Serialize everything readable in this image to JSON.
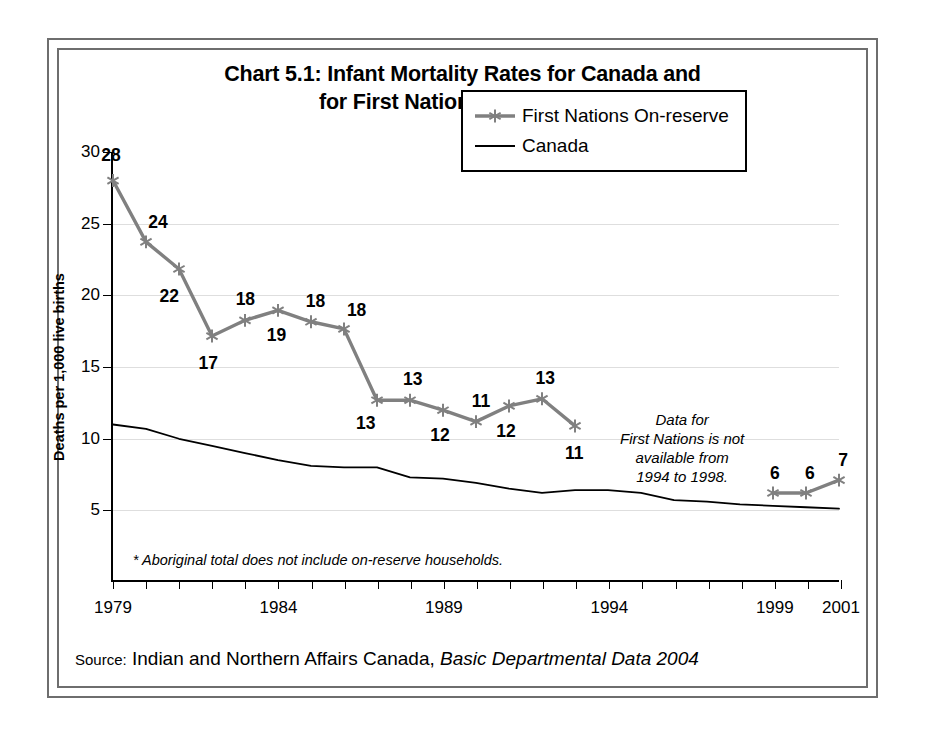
{
  "chart_data": {
    "type": "line",
    "xlabel": "",
    "ylabel": "Deaths per 1,000 live births",
    "xlim": [
      1979,
      2001
    ],
    "ylim": [
      0,
      30
    ],
    "yticks": [
      5,
      10,
      15,
      20,
      25,
      30
    ],
    "xticks": [
      1979,
      1980,
      1981,
      1982,
      1983,
      1984,
      1985,
      1986,
      1987,
      1988,
      1989,
      1990,
      1991,
      1992,
      1993,
      1994,
      1995,
      1996,
      1997,
      1998,
      1999,
      2000,
      2001
    ],
    "xtick_labels": [
      {
        "year": 1979,
        "label": "1979"
      },
      {
        "year": 1984,
        "label": "1984"
      },
      {
        "year": 1989,
        "label": "1989"
      },
      {
        "year": 1994,
        "label": "1994"
      },
      {
        "year": 1999,
        "label": "1999"
      },
      {
        "year": 2001,
        "label": "2001"
      }
    ],
    "grid": true,
    "legend_position": "upper right",
    "series": [
      {
        "name": "First Nations On-reserve",
        "color": "#808080",
        "marker": "asterisk",
        "show_labels": true,
        "segments": [
          {
            "points": [
              {
                "x": 1979,
                "y": 28,
                "label": "28",
                "lx": -2,
                "ly": -26
              },
              {
                "x": 1980,
                "y": 23.7,
                "label": "24",
                "lx": 12,
                "ly": -20
              },
              {
                "x": 1981,
                "y": 21.8,
                "label": "22",
                "lx": -10,
                "ly": 26
              },
              {
                "x": 1982,
                "y": 17.1,
                "label": "17",
                "lx": -4,
                "ly": 26
              },
              {
                "x": 1983,
                "y": 18.2,
                "label": "18",
                "lx": 0,
                "ly": -22
              },
              {
                "x": 1984,
                "y": 18.9,
                "label": "19",
                "lx": -2,
                "ly": 24
              },
              {
                "x": 1985,
                "y": 18.1,
                "label": "18",
                "lx": 4,
                "ly": -22
              },
              {
                "x": 1986,
                "y": 17.6,
                "label": "18",
                "lx": 12,
                "ly": -20
              },
              {
                "x": 1987,
                "y": 12.6,
                "label": "13",
                "lx": -12,
                "ly": 22
              },
              {
                "x": 1988,
                "y": 12.6,
                "label": "13",
                "lx": 2,
                "ly": -22
              },
              {
                "x": 1989,
                "y": 11.9,
                "label": "12",
                "lx": -4,
                "ly": 24
              },
              {
                "x": 1990,
                "y": 11.1,
                "label": "11",
                "lx": 4,
                "ly": -22
              },
              {
                "x": 1991,
                "y": 12.2,
                "label": "12",
                "lx": -4,
                "ly": 24
              },
              {
                "x": 1992,
                "y": 12.7,
                "label": "13",
                "lx": 2,
                "ly": -22
              },
              {
                "x": 1993,
                "y": 10.8,
                "label": "11",
                "lx": -2,
                "ly": 26
              }
            ]
          },
          {
            "points": [
              {
                "x": 1999,
                "y": 6.1,
                "label": "6",
                "lx": 0,
                "ly": -22
              },
              {
                "x": 2000,
                "y": 6.1,
                "label": "6",
                "lx": 2,
                "ly": -22
              },
              {
                "x": 2001,
                "y": 7.0,
                "label": "7",
                "lx": 2,
                "ly": -22
              }
            ]
          }
        ]
      },
      {
        "name": "Canada",
        "color": "#000000",
        "marker": "none",
        "show_labels": false,
        "segments": [
          {
            "points": [
              {
                "x": 1979,
                "y": 10.9
              },
              {
                "x": 1980,
                "y": 10.6
              },
              {
                "x": 1981,
                "y": 9.9
              },
              {
                "x": 1982,
                "y": 9.4
              },
              {
                "x": 1983,
                "y": 8.9
              },
              {
                "x": 1984,
                "y": 8.4
              },
              {
                "x": 1985,
                "y": 8.0
              },
              {
                "x": 1986,
                "y": 7.9
              },
              {
                "x": 1987,
                "y": 7.9
              },
              {
                "x": 1988,
                "y": 7.2
              },
              {
                "x": 1989,
                "y": 7.1
              },
              {
                "x": 1990,
                "y": 6.8
              },
              {
                "x": 1991,
                "y": 6.4
              },
              {
                "x": 1992,
                "y": 6.1
              },
              {
                "x": 1993,
                "y": 6.3
              },
              {
                "x": 1994,
                "y": 6.3
              },
              {
                "x": 1995,
                "y": 6.1
              },
              {
                "x": 1996,
                "y": 5.6
              },
              {
                "x": 1997,
                "y": 5.5
              },
              {
                "x": 1998,
                "y": 5.3
              },
              {
                "x": 1999,
                "y": 5.2
              },
              {
                "x": 2000,
                "y": 5.1
              },
              {
                "x": 2001,
                "y": 5.0
              }
            ]
          }
        ]
      }
    ],
    "annotations": [
      {
        "name": "no-data-note",
        "text": "Data for\nFirst Nations is not\navailable from\n1994 to 1998.",
        "x": 1996.2,
        "y": 9.2
      }
    ],
    "footnote": "* Aboriginal total does not include on-reserve households."
  },
  "legend": {
    "items": [
      {
        "label": "First Nations On-reserve",
        "style": "line-marker"
      },
      {
        "label": "Canada",
        "style": "line"
      }
    ]
  },
  "source": {
    "label": "Source:",
    "organization": " Indian and Northern Affairs Canada, ",
    "publication": "Basic Departmental Data 2004"
  }
}
